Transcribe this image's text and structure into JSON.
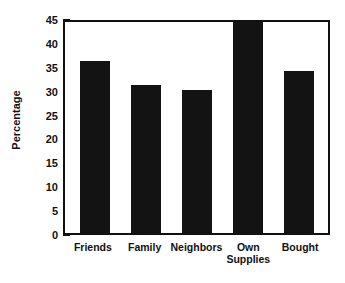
{
  "chart_data": {
    "type": "bar",
    "title": "",
    "xlabel": "",
    "ylabel": "Percentage",
    "ylim": [
      0,
      45
    ],
    "ytick_step": 5,
    "yticks": [
      "45",
      "40",
      "35",
      "30",
      "25",
      "20",
      "15",
      "10",
      "5",
      "0"
    ],
    "grid": false,
    "legend": "none",
    "bar_color": "#131313",
    "axis_color": "#111111",
    "background": "#ffffff",
    "categories": [
      "Friends",
      "Family",
      "Neighbors",
      "Own Supplies",
      "Bought"
    ],
    "values": [
      36,
      31,
      30,
      45,
      34
    ],
    "category_lines": [
      [
        "Friends"
      ],
      [
        "Family"
      ],
      [
        "Neighbors"
      ],
      [
        "Own",
        "Supplies"
      ],
      [
        "Bought"
      ]
    ]
  }
}
